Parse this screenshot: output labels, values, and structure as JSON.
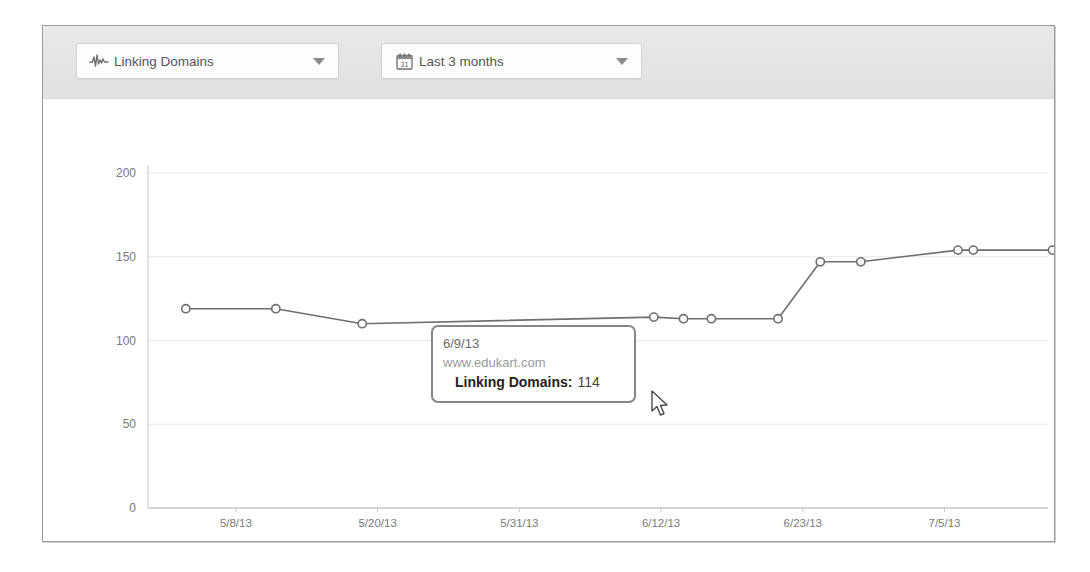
{
  "toolbar": {
    "metric_dropdown": {
      "icon": "pulse-waveform-icon",
      "label": "Linking Domains",
      "caret": "chevron-down-icon"
    },
    "period_dropdown": {
      "icon": "calendar-icon",
      "icon_day": "31",
      "label": "Last 3 months",
      "caret": "chevron-down-icon"
    }
  },
  "tooltip": {
    "date": "6/9/13",
    "site": "www.edukart.com",
    "metric_label": "Linking Domains:",
    "metric_value": "114"
  },
  "cursor": {
    "name": "mouse-pointer",
    "x": 612,
    "y": 300
  },
  "colors": {
    "toolbar_bg": "#e4e4e4",
    "frame_border": "#9a9a9a",
    "line": "#6f6f6f",
    "marker_fill": "#ffffff",
    "marker_stroke": "#6f6f6f",
    "grid": "#e8e8e8",
    "axis": "#c8c8c8",
    "tick_text": "#7a7a7a",
    "tooltip_border": "#878787"
  },
  "chart_data": {
    "type": "line",
    "title": "",
    "xlabel": "",
    "ylabel": "",
    "ylim": [
      0,
      200
    ],
    "yticks": [
      0,
      50,
      100,
      150,
      200
    ],
    "xtick_labels": [
      "5/8/13",
      "5/20/13",
      "5/31/13",
      "6/12/13",
      "6/23/13",
      "7/5/13"
    ],
    "grid": true,
    "legend": "none",
    "series": [
      {
        "name": "Linking Domains",
        "site": "www.edukart.com",
        "x": [
          "5/1/13",
          "5/8/13",
          "5/15/13",
          "6/9/13",
          "6/13/13",
          "6/17/13",
          "6/21/13",
          "6/25/13",
          "6/29/13",
          "7/3/13",
          "7/5/13",
          "7/12/13"
        ],
        "values": [
          119,
          119,
          110,
          114,
          113,
          113,
          113,
          147,
          147,
          154,
          154,
          154
        ],
        "highlighted_index": 3,
        "highlighted_value": 114
      }
    ]
  }
}
